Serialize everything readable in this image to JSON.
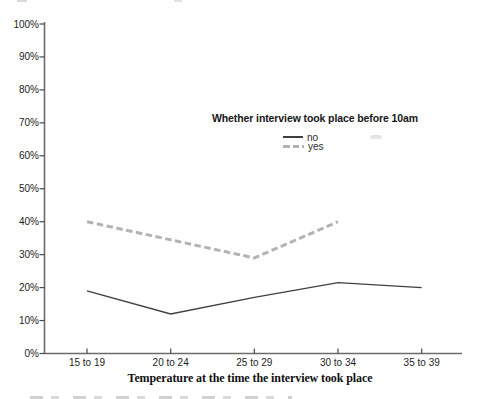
{
  "chart_data": {
    "type": "line",
    "title": "",
    "categories": [
      "15 to 19",
      "20 to 24",
      "25 to 29",
      "30 to 34",
      "35 to 39"
    ],
    "x_axis_title": "Temperature at the time the interview took place",
    "y_axis": {
      "min": 0,
      "max": 100,
      "tick_step": 10,
      "tick_labels": [
        "0%",
        "10%",
        "20%",
        "30%",
        "40%",
        "50%",
        "60%",
        "70%",
        "80%",
        "90%",
        "100%"
      ]
    },
    "legend": {
      "title": "Whether interview took place before 10am",
      "entries": [
        "no",
        "yes"
      ],
      "position": "inside-upper-right"
    },
    "grid": false,
    "series": [
      {
        "name": "no",
        "style": "solid",
        "color": "#3f3f3f",
        "width": 1.3,
        "values": [
          19,
          12,
          17,
          21.5,
          20
        ]
      },
      {
        "name": "yes",
        "style": "dashed",
        "color": "#b3b3b3",
        "width": 3,
        "values": [
          40,
          34.5,
          29,
          40,
          null
        ]
      }
    ],
    "axis_color": "#6b6b6b",
    "tick_color": "#4a4a4a"
  }
}
